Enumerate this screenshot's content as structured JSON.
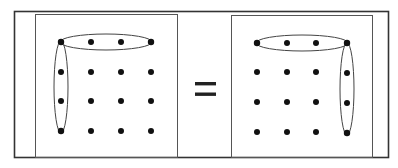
{
  "diagram": {
    "relation_symbol": "=",
    "colors": {
      "stroke": "#333333",
      "dot": "#111111",
      "background": "#ffffff"
    },
    "left_panel": {
      "grid": {
        "rows": 4,
        "cols": 4
      },
      "groupings": [
        {
          "name": "top-row",
          "dots": 4
        },
        {
          "name": "left-column",
          "dots": 4
        }
      ]
    },
    "right_panel": {
      "grid": {
        "rows": 4,
        "cols": 4
      },
      "groupings": [
        {
          "name": "top-row",
          "dots": 4
        },
        {
          "name": "right-column",
          "dots": 4
        }
      ]
    }
  }
}
